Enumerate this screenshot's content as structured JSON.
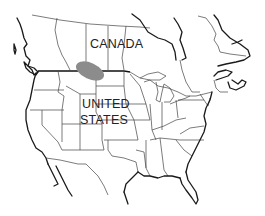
{
  "map": {
    "labels": {
      "canada": "CANADA",
      "united_states_line1": "UNITED",
      "united_states_line2": "STATES"
    },
    "highlight": {
      "shape": "ellipse",
      "color": "#8c8c8c",
      "region": "Canada–US border, northern Great Plains"
    },
    "colors": {
      "background": "#ffffff",
      "outline": "#1a1a1a",
      "borders": "#444444"
    }
  }
}
